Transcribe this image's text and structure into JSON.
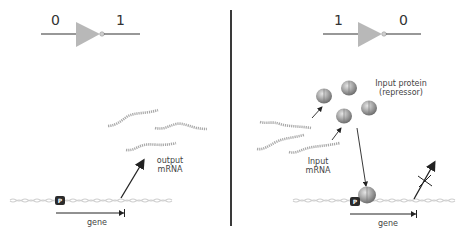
{
  "colors": {
    "background": "#ffffff",
    "divider": "#3a3a3a",
    "gate_fill": "#b8b8b8",
    "wire": "#333333",
    "mrna": "#a8a8a8",
    "dna": "#cfcfcf",
    "promoter": "#2b2b2b",
    "protein": "#9a9a9a",
    "arrow": "#222222",
    "text": "#444444"
  },
  "left_panel": {
    "gate": {
      "type": "NOT",
      "input": "0",
      "output": "1"
    },
    "mrna_label_line1": "output",
    "mrna_label_line2": "mRNA",
    "promoter_label": "P",
    "gene_label": "gene",
    "mrna_strands": 3,
    "transcription": "active"
  },
  "right_panel": {
    "gate": {
      "type": "NOT",
      "input": "1",
      "output": "0"
    },
    "protein_label_line1": "Input protein",
    "protein_label_line2": "(repressor)",
    "mrna_label_line1": "Input",
    "mrna_label_line2": "mRNA",
    "promoter_label": "P",
    "gene_label": "gene",
    "mrna_strands": 3,
    "proteins_free": 4,
    "proteins_bound": 1,
    "transcription": "blocked"
  }
}
